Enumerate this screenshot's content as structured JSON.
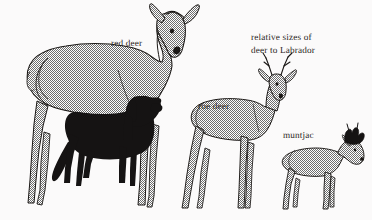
{
  "figure": {
    "title": "relative sizes of deer to Labrador",
    "background_color": "#fbfafa",
    "ink_color": "#1a1715",
    "halftone_color": "#8f8f8f",
    "silhouette_color": "#151313",
    "style": "halftone stipple line drawing"
  },
  "caption": {
    "line1": "relative sizes of",
    "line2": "deer to Labrador"
  },
  "labels": {
    "red_deer": "red deer",
    "roe_deer": "roe deer",
    "muntjac": "muntjac"
  },
  "animals": [
    {
      "name": "red deer",
      "label": "red deer",
      "fill": "halftone",
      "sex": "hind",
      "antlers": false,
      "facing": "right",
      "relative_height": 1.0
    },
    {
      "name": "labrador",
      "label": "",
      "fill": "solid-black",
      "antlers": false,
      "facing": "right",
      "relative_height": 0.47
    },
    {
      "name": "roe deer",
      "label": "roe deer",
      "fill": "halftone",
      "sex": "buck",
      "antlers": true,
      "facing": "right",
      "relative_height": 0.62
    },
    {
      "name": "muntjac",
      "label": "muntjac",
      "fill": "halftone",
      "sex": "buck",
      "antlers": true,
      "facing": "right",
      "relative_height": 0.37
    }
  ]
}
